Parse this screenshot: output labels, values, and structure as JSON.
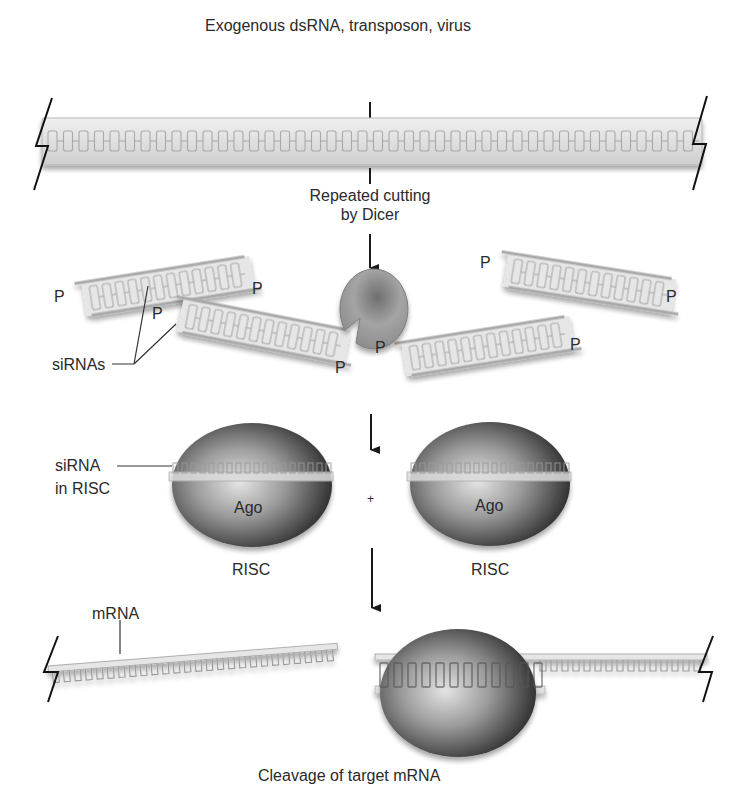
{
  "labels": {
    "source": "Exogenous dsRNA, transposon, virus",
    "dicer_step_line1": "Repeated cutting",
    "dicer_step_line2": "by Dicer",
    "sirnas": "siRNAs",
    "sirna_in_risc_line1": "siRNA",
    "sirna_in_risc_line2": "in RISC",
    "ago_left": "Ago",
    "ago_right": "Ago",
    "risc_left": "RISC",
    "risc_right": "RISC",
    "plus": "+",
    "mrna": "mRNA",
    "cleavage": "Cleavage of target mRNA",
    "phosphate": "P"
  },
  "colors": {
    "rna_fill": "#e6e6e6",
    "rna_stroke": "#a9a9a9",
    "dicer": "#9a9a9a",
    "ago_dark": "#2e2e2e",
    "ago_light": "#d8d8d8",
    "arrow": "#1a1a1a"
  }
}
